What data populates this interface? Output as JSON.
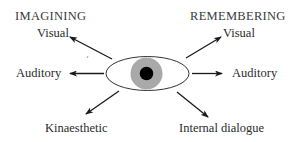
{
  "diagram": {
    "type": "eye-accessing-cues",
    "headings": {
      "left": "IMAGINING",
      "right": "REMEMBERING"
    },
    "labels": {
      "left_visual": "Visual",
      "left_auditory": "Auditory",
      "kinaesthetic": "Kinaesthetic",
      "right_visual": "Visual",
      "right_auditory": "Auditory",
      "internal_dialogue": "Internal dialogue"
    },
    "center": {
      "element": "eye",
      "iris_color": "#a9a9a9",
      "pupil_color": "#000000",
      "outline_color": "#333333"
    },
    "arrows": [
      {
        "from": "eye",
        "to": "left_visual",
        "direction": "up-left"
      },
      {
        "from": "eye",
        "to": "left_auditory",
        "direction": "left"
      },
      {
        "from": "eye",
        "to": "kinaesthetic",
        "direction": "down-left"
      },
      {
        "from": "eye",
        "to": "right_visual",
        "direction": "up-right"
      },
      {
        "from": "eye",
        "to": "right_auditory",
        "direction": "right"
      },
      {
        "from": "eye",
        "to": "internal_dialogue",
        "direction": "down-right"
      }
    ],
    "colors": {
      "text": "#2b2b2b",
      "arrow": "#1a1a1a",
      "background": "#ffffff"
    }
  }
}
